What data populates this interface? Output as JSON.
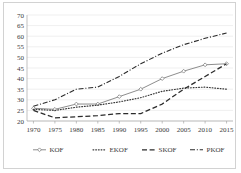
{
  "chart_data": {
    "type": "line",
    "title": "",
    "xlabel": "",
    "ylabel": "",
    "x": [
      1970,
      1975,
      1980,
      1985,
      1990,
      1995,
      2000,
      2005,
      2010,
      2015
    ],
    "xtick_labels": [
      "1970",
      "1975",
      "1980",
      "1985",
      "1990",
      "1995",
      "2000",
      "2005",
      "2010",
      "2015"
    ],
    "ytick_labels": [
      "20",
      "25",
      "30",
      "35",
      "40",
      "45",
      "50",
      "55",
      "60",
      "65",
      "70"
    ],
    "yticks": [
      20,
      25,
      30,
      35,
      40,
      45,
      50,
      55,
      60,
      65,
      70
    ],
    "ylim": [
      20,
      70
    ],
    "xlim": [
      1968.5,
      2016.5
    ],
    "grid": "horizontal",
    "legend_position": "bottom",
    "series": [
      {
        "name": "KOF",
        "style": "solid-marker",
        "color": "#808080",
        "marker": "diamond",
        "values": [
          26.0,
          25.5,
          28.0,
          28.0,
          31.5,
          35.0,
          40.0,
          43.5,
          46.5,
          47.0
        ]
      },
      {
        "name": "EKOF",
        "style": "dotted",
        "color": "#3a3a3a",
        "marker": "none",
        "values": [
          25.5,
          25.0,
          26.5,
          27.5,
          29.0,
          31.0,
          34.0,
          35.5,
          36.0,
          35.0
        ]
      },
      {
        "name": "SKOF",
        "style": "dashed",
        "color": "#2b2b2b",
        "marker": "none",
        "values": [
          25.0,
          21.5,
          22.0,
          22.5,
          23.5,
          23.5,
          28.0,
          35.0,
          41.0,
          47.0
        ]
      },
      {
        "name": "PKOF",
        "style": "dash-dot",
        "color": "#2b2b2b",
        "marker": "none",
        "values": [
          27.0,
          30.0,
          35.0,
          36.0,
          41.0,
          47.0,
          52.0,
          56.0,
          59.0,
          61.5
        ]
      }
    ]
  },
  "legend": {
    "items": [
      {
        "label": "KOF"
      },
      {
        "label": "EKOF"
      },
      {
        "label": "SKOF"
      },
      {
        "label": "PKOF"
      }
    ]
  }
}
